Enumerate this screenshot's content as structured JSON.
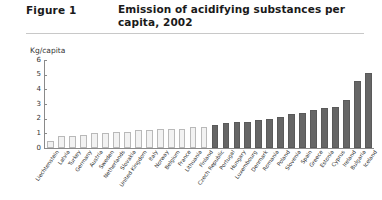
{
  "header": {
    "figure_label": "Figure 1",
    "title": "Emission of acidifying substances per capita, 2002"
  },
  "chart_data": {
    "type": "bar",
    "title": "Emission of acidifying substances per capita, 2002",
    "xlabel": "",
    "ylabel": "Kg/capita",
    "ylim": [
      0,
      6
    ],
    "yticks": [
      0,
      1,
      2,
      3,
      4,
      5,
      6
    ],
    "grid": false,
    "legend": "none",
    "unit_label": "Kg/capita",
    "series_colors": {
      "light_bar": "#f2f2f2",
      "light_bar_border": "#b9b9b9",
      "dark_bar": "#666666",
      "axis": "#8a8a8a"
    },
    "categories": [
      "Liechtenstein",
      "Latvia",
      "Turkey",
      "Germany",
      "Austria",
      "Sweden",
      "Netherlands",
      "Slovakia",
      "United Kingdom",
      "Italy",
      "Norway",
      "Belgium",
      "France",
      "Lithuania",
      "Finland",
      "Czech Republic",
      "Portugal",
      "Hungary",
      "Luxembourg",
      "Denmark",
      "Romania",
      "Poland",
      "Slovenia",
      "Spain",
      "Greece",
      "Estonia",
      "Cyprus",
      "Ireland",
      "Bulgaria",
      "Iceland"
    ],
    "values": [
      0.5,
      0.8,
      0.8,
      0.9,
      1.0,
      1.0,
      1.1,
      1.1,
      1.2,
      1.2,
      1.3,
      1.3,
      1.3,
      1.4,
      1.4,
      1.6,
      1.7,
      1.8,
      1.8,
      1.9,
      2.0,
      2.1,
      2.3,
      2.4,
      2.6,
      2.7,
      2.8,
      3.3,
      4.6,
      5.1
    ],
    "shades": [
      "light",
      "light",
      "light",
      "light",
      "light",
      "light",
      "light",
      "light",
      "light",
      "light",
      "light",
      "light",
      "light",
      "light",
      "light",
      "dark",
      "dark",
      "dark",
      "dark",
      "dark",
      "dark",
      "dark",
      "dark",
      "dark",
      "dark",
      "dark",
      "dark",
      "dark",
      "dark",
      "dark"
    ]
  }
}
